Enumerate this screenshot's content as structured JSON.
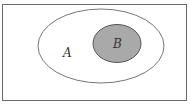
{
  "diagram": {
    "type": "venn",
    "universe": {
      "stroke": "#666666"
    },
    "sets": [
      {
        "id": "A",
        "label": "A",
        "fill": "#ffffff",
        "stroke": "#777777"
      },
      {
        "id": "B",
        "label": "B",
        "fill": "#a9a9a9",
        "stroke": "#555555",
        "subset_of": "A"
      }
    ]
  }
}
